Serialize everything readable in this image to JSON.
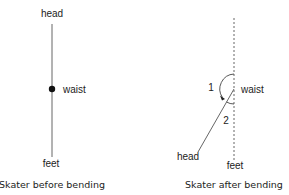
{
  "diagram": {
    "left_panel": {
      "caption": "Skater before bending",
      "labels": {
        "head": "head",
        "waist": "waist",
        "feet": "feet"
      }
    },
    "right_panel": {
      "caption": "Skater after bending",
      "labels": {
        "head": "head",
        "waist": "waist",
        "feet": "feet",
        "angle1": "1",
        "angle2": "2"
      }
    },
    "colors": {
      "line": "#555555",
      "dot": "#111111",
      "text": "#222222"
    }
  }
}
